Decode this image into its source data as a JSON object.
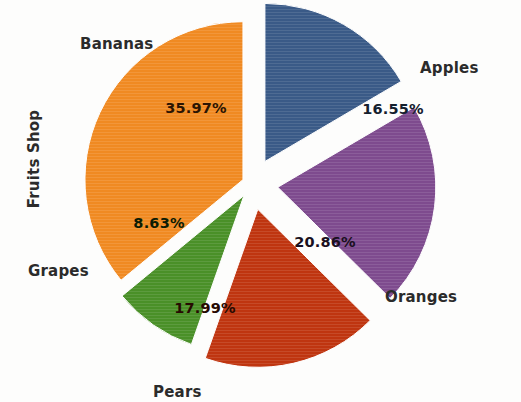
{
  "chart_data": {
    "type": "pie",
    "title": "",
    "ylabel": "Fruits Shop",
    "xlabel": "",
    "grid": false,
    "legend": "none",
    "label_style": "outside-category-inside-percent",
    "exploded": true,
    "categories": [
      "Apples",
      "Oranges",
      "Pears",
      "Grapes",
      "Bananas"
    ],
    "values": [
      16.55,
      20.86,
      17.99,
      8.63,
      35.97
    ],
    "value_labels": [
      "16.55%",
      "20.86%",
      "17.99%",
      "8.63%",
      "35.97%"
    ],
    "colors": [
      "#3a5a87",
      "#7e4b8e",
      "#bf3510",
      "#4a9028",
      "#f08a22"
    ],
    "slices": [
      {
        "name": "Apples",
        "value": 16.55,
        "label": "16.55%",
        "color": "#3a5a87",
        "label_color": "#14202e",
        "start_angle": 0,
        "end_angle": 59.58,
        "explode": 26,
        "cat_x": 420,
        "cat_y": 59,
        "pct_x": 393,
        "pct_y": 110
      },
      {
        "name": "Oranges",
        "value": 20.86,
        "label": "20.86%",
        "color": "#7e4b8e",
        "label_color": "#1a1020",
        "start_angle": 59.58,
        "end_angle": 134.68,
        "explode": 26,
        "cat_x": 385,
        "cat_y": 288,
        "pct_x": 325,
        "pct_y": 243
      },
      {
        "name": "Pears",
        "value": 17.99,
        "label": "17.99%",
        "color": "#bf3510",
        "label_color": "#270a02",
        "start_angle": 134.68,
        "end_angle": 199.44,
        "explode": 26,
        "cat_x": 153,
        "cat_y": 383,
        "pct_x": 205,
        "pct_y": 309
      },
      {
        "name": "Grapes",
        "value": 8.63,
        "label": "8.63%",
        "color": "#4a9028",
        "label_color": "#0c1c04",
        "start_angle": 199.44,
        "end_angle": 230.51,
        "explode": 14,
        "cat_x": 28,
        "cat_y": 262,
        "pct_x": 159,
        "pct_y": 224
      },
      {
        "name": "Bananas",
        "value": 35.97,
        "label": "35.97%",
        "color": "#f08a22",
        "label_color": "#2b1402",
        "start_angle": 230.51,
        "end_angle": 360,
        "explode": 10,
        "cat_x": 80,
        "cat_y": 35,
        "pct_x": 196,
        "pct_y": 109
      }
    ],
    "center": {
      "x": 252,
      "y": 184
    },
    "radius": 158,
    "total": 100.0
  }
}
